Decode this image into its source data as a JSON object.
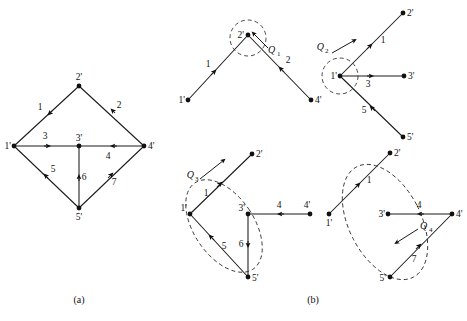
{
  "figure": {
    "caption_a": "(a)",
    "caption_b": "(b)",
    "background": "#ffffff",
    "ink": "#111111"
  },
  "panel_a": {
    "name": "original-directed-graph",
    "nodes": [
      {
        "id": "n1",
        "label": "1'",
        "x": 14,
        "y": 146
      },
      {
        "id": "n2",
        "label": "2'",
        "x": 79,
        "y": 86
      },
      {
        "id": "n3",
        "label": "3'",
        "x": 79,
        "y": 146
      },
      {
        "id": "n4",
        "label": "4'",
        "x": 144,
        "y": 146
      },
      {
        "id": "n5",
        "label": "5'",
        "x": 79,
        "y": 208
      }
    ],
    "edges": [
      {
        "label": "1",
        "from": "n2",
        "to": "n1"
      },
      {
        "label": "2",
        "from": "n4",
        "to": "n2"
      },
      {
        "label": "3",
        "from": "n1",
        "to": "n3"
      },
      {
        "label": "4",
        "from": "n4",
        "to": "n3"
      },
      {
        "label": "5",
        "from": "n5",
        "to": "n1"
      },
      {
        "label": "6",
        "from": "n5",
        "to": "n3"
      },
      {
        "label": "7",
        "from": "n5",
        "to": "n4"
      }
    ]
  },
  "panel_b": {
    "name": "quotient-decomposition-graphs",
    "subpanels": [
      {
        "name": "q1-subgraph",
        "marker": "Q",
        "marker_sub": "1",
        "nodes": [
          {
            "id": "n1",
            "label": "1'",
            "x": 188,
            "y": 100
          },
          {
            "id": "n2",
            "label": "2'",
            "x": 248,
            "y": 35
          },
          {
            "id": "n4",
            "label": "4'",
            "x": 311,
            "y": 100
          }
        ],
        "edges": [
          {
            "label": "1",
            "from": "n1",
            "to": "n2"
          },
          {
            "label": "2",
            "from": "n4",
            "to": "n2"
          }
        ]
      },
      {
        "name": "q2-subgraph",
        "marker": "Q",
        "marker_sub": "2",
        "nodes": [
          {
            "id": "n1",
            "label": "1'",
            "x": 340,
            "y": 76
          },
          {
            "id": "n2",
            "label": "2'",
            "x": 403,
            "y": 13
          },
          {
            "id": "n3",
            "label": "3'",
            "x": 404,
            "y": 76
          },
          {
            "id": "n5",
            "label": "5'",
            "x": 403,
            "y": 137
          }
        ],
        "edges": [
          {
            "label": "1",
            "from": "n1",
            "to": "n2"
          },
          {
            "label": "3",
            "from": "n1",
            "to": "n3"
          },
          {
            "label": "5",
            "from": "n5",
            "to": "n1"
          }
        ]
      },
      {
        "name": "q3-subgraph",
        "marker": "Q",
        "marker_sub": "3",
        "nodes": [
          {
            "id": "n1",
            "label": "1'",
            "x": 190,
            "y": 214
          },
          {
            "id": "n2",
            "label": "2'",
            "x": 252,
            "y": 154
          },
          {
            "id": "n3",
            "label": "3'",
            "x": 248,
            "y": 214
          },
          {
            "id": "n4",
            "label": "4'",
            "x": 310,
            "y": 214
          },
          {
            "id": "n5",
            "label": "5'",
            "x": 248,
            "y": 277
          }
        ],
        "edges": [
          {
            "label": "1",
            "from": "n1",
            "to": "n2"
          },
          {
            "label": "4",
            "from": "n4",
            "to": "n3"
          },
          {
            "label": "5",
            "from": "n1",
            "to": "n5"
          },
          {
            "label": "6",
            "from": "n3",
            "to": "n5"
          }
        ]
      },
      {
        "name": "q4-subgraph",
        "marker": "Q",
        "marker_sub": "4",
        "nodes": [
          {
            "id": "n1",
            "label": "1'",
            "x": 329,
            "y": 214
          },
          {
            "id": "n2",
            "label": "2'",
            "x": 390,
            "y": 153
          },
          {
            "id": "n3",
            "label": "3'",
            "x": 388,
            "y": 214
          },
          {
            "id": "n4",
            "label": "4'",
            "x": 452,
            "y": 214
          },
          {
            "id": "n5",
            "label": "5'",
            "x": 390,
            "y": 277
          }
        ],
        "edges": [
          {
            "label": "1",
            "from": "n1",
            "to": "n2"
          },
          {
            "label": "4",
            "from": "n4",
            "to": "n3"
          },
          {
            "label": "7",
            "from": "n5",
            "to": "n4"
          }
        ]
      }
    ]
  }
}
